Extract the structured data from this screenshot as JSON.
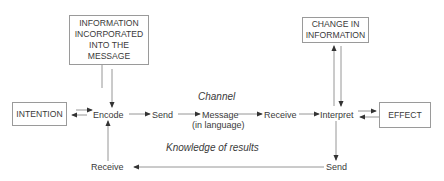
{
  "diagram": {
    "boxes": {
      "information_incorporated": "INFORMATION INCORPORATED INTO THE MESSAGE",
      "change_in_information": "CHANGE IN INFORMATION",
      "intention": "INTENTION",
      "effect": "EFFECT"
    },
    "nodes": {
      "encode": "Encode",
      "send_1": "Send",
      "message": "Message",
      "message_sub": "(in language)",
      "receive_1": "Receive",
      "interpret": "Interpret",
      "send_2": "Send",
      "receive_2": "Receive"
    },
    "annotations": {
      "channel": "Channel",
      "knowledge_of_results": "Knowledge of results"
    },
    "colors": {
      "line": "#8a8a8a",
      "arrowhead": "#333333",
      "text": "#3a3a3a"
    }
  }
}
